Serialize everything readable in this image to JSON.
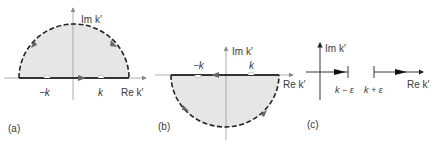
{
  "colors": {
    "fill": "#e6e6e6",
    "contour": "#2a2a2a",
    "axis": "#9a9a9a",
    "arrow": "#6b6b6b",
    "text": "#3a3a3a"
  },
  "panels": [
    {
      "id": "a",
      "label": "(a)",
      "im_axis_label": "Im k′",
      "re_axis_label": "Re k′",
      "pole_left": "−k",
      "pole_right": "k",
      "contour": "upper semicircle, closed counter-clockwise"
    },
    {
      "id": "b",
      "label": "(b)",
      "im_axis_label": "Im k′",
      "re_axis_label": "Re k′",
      "pole_left": "−k",
      "pole_right": "k",
      "contour": "lower semicircle, closed clockwise"
    },
    {
      "id": "c",
      "label": "(c)",
      "im_axis_label": "Im k′",
      "re_axis_label": "Re k′",
      "endpoint_left": "k − ε",
      "endpoint_right": "k + ε",
      "contour": "principal value: real axis with gap around k"
    }
  ]
}
